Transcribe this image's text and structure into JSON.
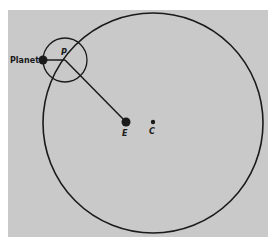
{
  "diagram": {
    "type": "epicycle-model",
    "labels": {
      "planet": "Planet",
      "epicycle_center": "P",
      "earth": "E",
      "deferent_center": "C"
    },
    "colors": {
      "background": "#c9c9c9",
      "stroke": "#1a1a1a"
    }
  }
}
